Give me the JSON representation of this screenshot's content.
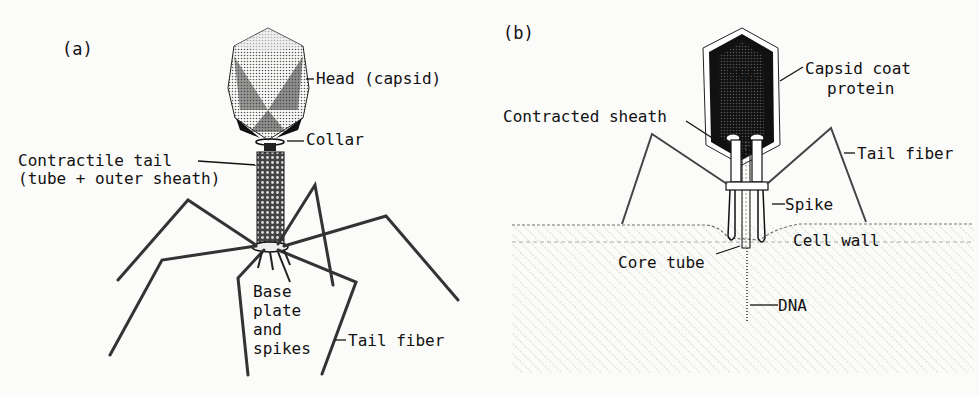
{
  "diagram": {
    "panels": [
      {
        "id": "a",
        "letter": "(a)",
        "labels": {
          "head": "Head (capsid)",
          "collar": "Collar",
          "tail_line1": "Contractile tail",
          "tail_line2": "(tube + outer sheath)",
          "base_line1": "Base",
          "base_line2": "plate",
          "base_line3": "and",
          "base_line4": "spikes",
          "tail_fiber": "Tail fiber"
        }
      },
      {
        "id": "b",
        "letter": "(b)",
        "labels": {
          "dna_in_head": "DNA",
          "capsid_line1": "Capsid coat",
          "capsid_line2": "protein",
          "contracted_sheath": "Contracted sheath",
          "tail_fiber": "Tail fiber",
          "spike": "Spike",
          "cell_wall": "Cell wall",
          "core_tube": "Core tube",
          "dna_injected": "DNA"
        }
      }
    ]
  },
  "colors": {
    "ink": "#111111",
    "paper": "#fbfbf9",
    "stipple": "#9a9a9a",
    "hatch": "#b5b5b5"
  }
}
